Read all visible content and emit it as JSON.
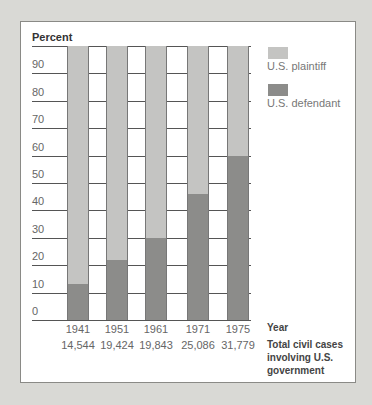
{
  "chart_data": {
    "type": "bar",
    "stacked": true,
    "title": "",
    "ylabel": "Percent",
    "xlabel": "Year",
    "ylim": [
      0,
      100
    ],
    "yticks": [
      0,
      10,
      20,
      30,
      40,
      50,
      60,
      70,
      80,
      90
    ],
    "categories": [
      "1941",
      "1951",
      "1961",
      "1971",
      "1975"
    ],
    "series": [
      {
        "name": "U.S. defendant",
        "color": "#8c8c8a",
        "values": [
          13,
          22,
          30,
          46,
          60
        ]
      },
      {
        "name": "U.S. plaintiff",
        "color": "#c4c4c2",
        "values": [
          87,
          78,
          70,
          54,
          40
        ]
      }
    ],
    "secondary_labels": {
      "title": "Total civil cases involving U.S. government",
      "values": [
        "14,544",
        "19,424",
        "19,843",
        "25,086",
        "31,779"
      ]
    },
    "legend_position": "right",
    "grid": true
  },
  "labels": {
    "ylabel": "Percent",
    "xlabel": "Year",
    "cases_line1": "Total civil cases",
    "cases_line2": "involving U.S.",
    "cases_line3": "government",
    "legend_plaintiff": "U.S. plaintiff",
    "legend_defendant": "U.S. defendant",
    "ticks": [
      "0",
      "10",
      "20",
      "30",
      "40",
      "50",
      "60",
      "70",
      "80",
      "90"
    ],
    "years": [
      "1941",
      "1951",
      "1961",
      "1971",
      "1975"
    ],
    "cases": [
      "14,544",
      "19,424",
      "19,843",
      "25,086",
      "31,779"
    ]
  }
}
